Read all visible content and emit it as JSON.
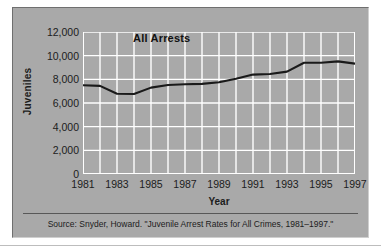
{
  "figure": {
    "clipped_title_ghost": "Juvenile Arrest Rates for All Crimes",
    "series_label": "All Arrests",
    "source_note": "Source: Snyder, Howard. \"Juvenile Arrest Rates for All Crimes, 1981–1997.\"",
    "panel_bg": "#a9a9a9",
    "grid_color": "#ffffff",
    "line_color": "#1a1a1a",
    "text_color": "#1c1c1c"
  },
  "chart_data": {
    "type": "line",
    "title": "",
    "xlabel": "Year",
    "ylabel": "Juveniles",
    "xlim": [
      1981,
      1997
    ],
    "ylim": [
      0,
      12000
    ],
    "grid": true,
    "legend": "inline-label",
    "x_ticks": [
      "1981",
      "1983",
      "1985",
      "1987",
      "1989",
      "1991",
      "1993",
      "1995",
      "1997"
    ],
    "y_ticks": [
      "0",
      "2,000",
      "4,000",
      "6,000",
      "8,000",
      "10,000",
      "12,000"
    ],
    "y_tick_values": [
      0,
      2000,
      4000,
      6000,
      8000,
      10000,
      12000
    ],
    "x": [
      1981,
      1982,
      1983,
      1984,
      1985,
      1986,
      1987,
      1988,
      1989,
      1990,
      1991,
      1992,
      1993,
      1994,
      1995,
      1996,
      1997
    ],
    "series": [
      {
        "name": "All Arrests",
        "values": [
          7500,
          7450,
          6780,
          6760,
          7300,
          7520,
          7580,
          7620,
          7750,
          8050,
          8400,
          8450,
          8650,
          9400,
          9400,
          9520,
          9330
        ]
      }
    ]
  }
}
